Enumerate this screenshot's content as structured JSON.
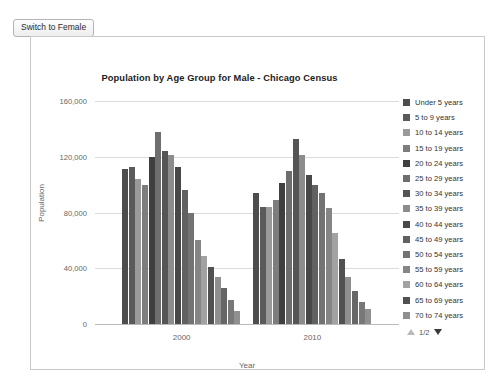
{
  "toolbar": {
    "switch_label": "Switch to Female"
  },
  "chart_data": {
    "type": "bar",
    "title": "Population by Age Group for Male - Chicago Census",
    "xlabel": "Year",
    "ylabel": "Population",
    "grid": true,
    "legend_position": "right",
    "categories": [
      "2000",
      "2010"
    ],
    "ylim": [
      0,
      160000
    ],
    "yticks": [
      "0",
      "40,000",
      "80,000",
      "120,000",
      "160,000"
    ],
    "ytick_values": [
      0,
      40000,
      80000,
      120000,
      160000
    ],
    "series": [
      {
        "name": "Under 5 years",
        "color": "#4d4d4d",
        "values": [
          111000,
          94000
        ]
      },
      {
        "name": "5 to 9 years",
        "color": "#5a5a5a",
        "values": [
          113000,
          84000
        ]
      },
      {
        "name": "10 to 14 years",
        "color": "#9a9a9a",
        "values": [
          104000,
          84000
        ]
      },
      {
        "name": "15 to 19 years",
        "color": "#7d7d7d",
        "values": [
          100000,
          89000
        ]
      },
      {
        "name": "20 to 24 years",
        "color": "#3f3f3f",
        "values": [
          120000,
          101000
        ]
      },
      {
        "name": "25 to 29 years",
        "color": "#6e6e6e",
        "values": [
          138000,
          110000
        ]
      },
      {
        "name": "30 to 34 years",
        "color": "#555555",
        "values": [
          124000,
          133000
        ]
      },
      {
        "name": "35 to 39 years",
        "color": "#8c8c8c",
        "values": [
          121000,
          121000
        ]
      },
      {
        "name": "40 to 44 years",
        "color": "#484848",
        "values": [
          113000,
          107000
        ]
      },
      {
        "name": "45 to 49 years",
        "color": "#616161",
        "values": [
          96000,
          100000
        ]
      },
      {
        "name": "50 to 54 years",
        "color": "#737373",
        "values": [
          80000,
          94000
        ]
      },
      {
        "name": "55 to 59 years",
        "color": "#858585",
        "values": [
          60000,
          83000
        ]
      },
      {
        "name": "60 to 64 years",
        "color": "#a2a2a2",
        "values": [
          49000,
          65000
        ]
      },
      {
        "name": "65 to 69 years",
        "color": "#515151",
        "values": [
          41000,
          47000
        ]
      },
      {
        "name": "70 to 74 years",
        "color": "#8f8f8f",
        "values": [
          34000,
          34000
        ]
      },
      {
        "name": "75 to 79 years",
        "color": "#666666",
        "values": [
          26000,
          24000
        ]
      },
      {
        "name": "80 to 84 years",
        "color": "#787878",
        "values": [
          17000,
          16000
        ]
      },
      {
        "name": "85 years and over",
        "color": "#909090",
        "values": [
          9000,
          11000
        ]
      }
    ]
  },
  "legend": {
    "items": [
      "Under 5 years",
      "5 to 9 years",
      "10 to 14 years",
      "15 to 19 years",
      "20 to 24 years",
      "25 to 29 years",
      "30 to 34 years",
      "35 to 39 years",
      "40 to 44 years",
      "45 to 49 years",
      "50 to 54 years",
      "55 to 59 years",
      "60 to 64 years",
      "65 to 69 years",
      "70 to 74 years"
    ],
    "pager": "1/2"
  }
}
